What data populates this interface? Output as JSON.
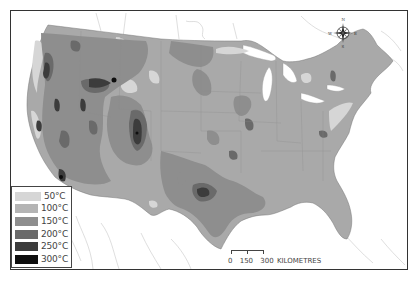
{
  "map": {
    "type": "thematic choropleth",
    "region": "Contiguous United States",
    "palette": {
      "land_base": "#a9a9a9",
      "water": "#ffffff",
      "border": "#333333",
      "state_lines": "#8c8c8c",
      "outside_lines": "#c8c8c8"
    }
  },
  "legend": {
    "items": [
      {
        "label": "50°C",
        "color": "#d6d6d6"
      },
      {
        "label": "100°C",
        "color": "#b4b4b4"
      },
      {
        "label": "150°C",
        "color": "#8e8e8e"
      },
      {
        "label": "200°C",
        "color": "#6a6a6a"
      },
      {
        "label": "250°C",
        "color": "#3c3c3c"
      },
      {
        "label": "300°C",
        "color": "#0e0e0e"
      }
    ]
  },
  "scale_bar": {
    "ticks": [
      "0",
      "150",
      "300"
    ],
    "unit": "KILOMETRES"
  },
  "compass": {
    "north": "N",
    "south": "S",
    "east": "E",
    "west": "W"
  }
}
